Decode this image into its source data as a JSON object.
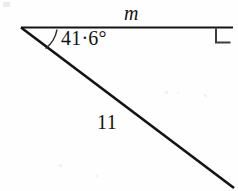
{
  "figure": {
    "type": "right-triangle-diagram",
    "background_color": "#ffffff",
    "stroke_color": "#141414",
    "labels": {
      "top_side": "m",
      "angle": "41·6°",
      "hypotenuse": "11"
    },
    "values": {
      "angle_degrees": 41.6,
      "hypotenuse_length": 11,
      "right_angle_degrees": 90,
      "unknown_side": "m"
    },
    "geometry": {
      "vertex_left": [
        21,
        27
      ],
      "vertex_top_right": [
        233,
        27
      ],
      "vertex_bottom_right": [
        233,
        187
      ],
      "top_line_width": 2,
      "hypotenuse_line_width": 2.6,
      "right_angle_marker_size": 14
    }
  }
}
